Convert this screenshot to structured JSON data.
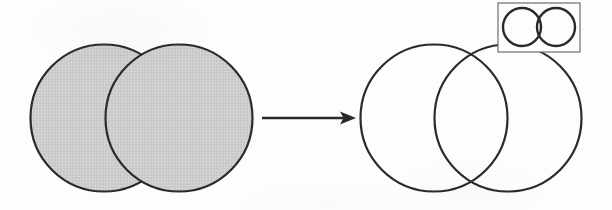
{
  "figure": {
    "description": "Two shaded overlapping circles transform, via a rightward arrow, into two outlined overlapping circles whose lens-shaped intersection is visible; an inset box at the upper right repeats the motif in miniature.",
    "width": 612,
    "height": 210,
    "background_color": "#fdfdfc",
    "stroke_color": "#2b2b2b",
    "fill_gray": "#c8c8c8",
    "inset_frame_color": "#6e6e6e"
  },
  "left_group": {
    "name": "shaded-overlapping-circles",
    "fill": "#c8c8c8",
    "stroke": "#2b2b2b",
    "stroke_width": 2.2,
    "circles": [
      {
        "label": "left-circle",
        "cx": 104,
        "cy": 118,
        "r": 73.5
      },
      {
        "label": "right-circle",
        "cx": 179,
        "cy": 118,
        "r": 73.5
      }
    ]
  },
  "arrow": {
    "name": "transformation-arrow",
    "direction": "right",
    "stroke": "#2b2b2b",
    "stroke_width": 2.4,
    "x_start": 262,
    "x_end": 356,
    "y": 118,
    "head_length": 16,
    "head_half_height": 6.5
  },
  "right_group": {
    "name": "outlined-overlapping-circles",
    "fill": "none",
    "stroke": "#2b2b2b",
    "stroke_width": 2.2,
    "circles": [
      {
        "label": "left-circle",
        "cx": 434,
        "cy": 118,
        "r": 73.5
      },
      {
        "label": "right-circle",
        "cx": 508,
        "cy": 118,
        "r": 73.5
      }
    ],
    "intersection": {
      "label": "lens-intersection",
      "top_crossing_x": 471,
      "top_crossing_y": 55,
      "bottom_crossing_x": 471,
      "bottom_crossing_y": 182
    }
  },
  "inset": {
    "name": "inset-detail-box",
    "frame": {
      "x": 498,
      "y": 3,
      "width": 82,
      "height": 49
    },
    "frame_stroke": "#6e6e6e",
    "frame_stroke_width": 1.2,
    "circles": [
      {
        "label": "left-circle",
        "cx": 522,
        "cy": 27,
        "r": 19
      },
      {
        "label": "right-circle",
        "cx": 556,
        "cy": 27,
        "r": 19
      }
    ],
    "circle_stroke": "#2b2b2b",
    "circle_stroke_width": 2.4
  }
}
